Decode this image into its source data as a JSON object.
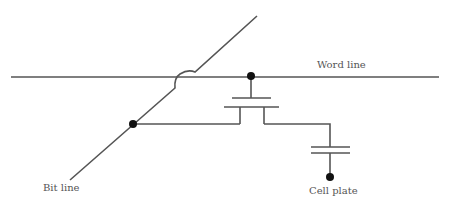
{
  "diagram": {
    "labels": {
      "word_line": "Word line",
      "bit_line": "Bit line",
      "cell_plate": "Cell plate"
    },
    "components": [
      "access-transistor",
      "storage-capacitor"
    ],
    "colors": {
      "line": "#555555",
      "dot": "#111111",
      "background": "#ffffff"
    }
  }
}
